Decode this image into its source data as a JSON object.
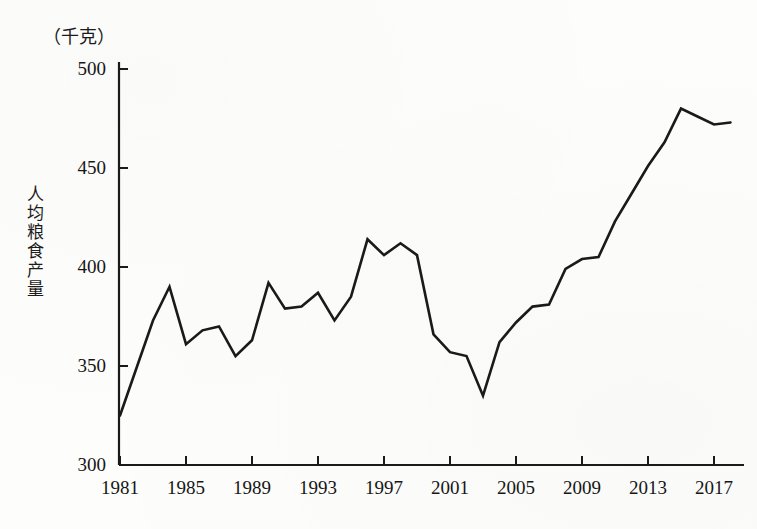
{
  "chart_data": {
    "type": "line",
    "title": "",
    "unit_label": "（千克）",
    "ylabel": "人均粮食产量",
    "xlabel": "",
    "ylim": [
      300,
      500
    ],
    "xlim": [
      1981,
      2018
    ],
    "yticks": [
      300,
      350,
      400,
      450,
      500
    ],
    "xticks": [
      1981,
      1985,
      1989,
      1993,
      1997,
      2001,
      2005,
      2009,
      2013,
      2017
    ],
    "grid": false,
    "legend": "none",
    "line_color": "#1a1a1a",
    "series": [
      {
        "name": "人均粮食产量",
        "x": [
          1981,
          1982,
          1983,
          1984,
          1985,
          1986,
          1987,
          1988,
          1989,
          1990,
          1991,
          1992,
          1993,
          1994,
          1995,
          1996,
          1997,
          1998,
          1999,
          2000,
          2001,
          2002,
          2003,
          2004,
          2005,
          2006,
          2007,
          2008,
          2009,
          2010,
          2011,
          2012,
          2013,
          2014,
          2015,
          2016,
          2017,
          2018
        ],
        "values": [
          325,
          349,
          373,
          390,
          361,
          368,
          370,
          355,
          363,
          392,
          379,
          380,
          387,
          373,
          385,
          414,
          406,
          412,
          406,
          366,
          357,
          355,
          335,
          362,
          372,
          380,
          381,
          399,
          404,
          405,
          423,
          437,
          451,
          463,
          480,
          476,
          472,
          473
        ]
      }
    ]
  },
  "axis": {
    "ytick_labels": [
      "500",
      "450",
      "400",
      "350",
      "300"
    ],
    "xtick_labels": [
      "1981",
      "1985",
      "1989",
      "1993",
      "1997",
      "2001",
      "2005",
      "2009",
      "2013",
      "2017"
    ]
  }
}
